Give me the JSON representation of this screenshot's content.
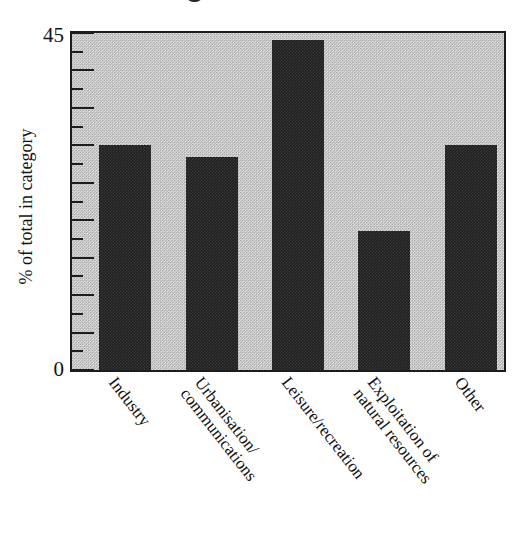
{
  "figure": {
    "background_color": "#ffffff",
    "plot_background_color": "#bdbdbd",
    "bar_color": "#201f1f",
    "axis_color": "#1c1c1c",
    "top_fragment_name": "cut-off-glyph-fragment"
  },
  "chart_data": {
    "type": "bar",
    "title": "",
    "xlabel": "",
    "ylabel": "% of total in category",
    "ylim": [
      0,
      45
    ],
    "grid": false,
    "legend": null,
    "y_ticks_major": [
      0,
      5,
      10,
      15,
      20,
      25,
      30,
      35,
      40,
      45
    ],
    "y_tick_labels_shown": [
      "0",
      "45"
    ],
    "y_minor_tick_interval": 2.5,
    "categories": [
      "Industry",
      "Urbanisation/ communications",
      "Leisure/recreation",
      "Exploitation of natural resources",
      "Other"
    ],
    "values": [
      30,
      28.5,
      44,
      18.5,
      30
    ]
  },
  "y_axis": {
    "title": "% of total in category",
    "label_top": "45",
    "label_bottom": "0"
  },
  "x_axis": {
    "labels": [
      {
        "line1": "Industry",
        "line2": ""
      },
      {
        "line1": "Urbanisation/",
        "line2": "communications"
      },
      {
        "line1": "Leisure/recreation",
        "line2": ""
      },
      {
        "line1": "Exploitation of",
        "line2": "natural resources"
      },
      {
        "line1": "Other",
        "line2": ""
      }
    ]
  },
  "bars": [
    {
      "label": "Industry",
      "value": 30
    },
    {
      "label": "Urbanisation/ communications",
      "value": 28.5
    },
    {
      "label": "Leisure/recreation",
      "value": 44
    },
    {
      "label": "Exploitation of natural resources",
      "value": 18.5
    },
    {
      "label": "Other",
      "value": 30
    }
  ]
}
